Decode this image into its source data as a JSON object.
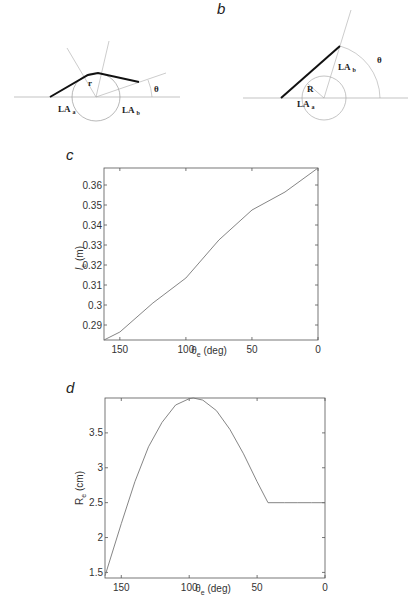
{
  "panels": {
    "a": {
      "label": "",
      "labels": {
        "r": "r",
        "la_a": "LA",
        "la_a_sub": "a",
        "la_b": "LA",
        "la_b_sub": "b",
        "theta": "θ"
      }
    },
    "b": {
      "label": "b",
      "labels": {
        "R": "R",
        "la_a": "LA",
        "la_a_sub": "a",
        "la_b": "LA",
        "la_b_sub": "b",
        "theta": "θ"
      }
    },
    "c": {
      "label": "c"
    },
    "d": {
      "label": "d"
    }
  },
  "chart_data": [
    {
      "panel": "c",
      "type": "line",
      "title": "",
      "xlabel": "θe (deg)",
      "ylabel": "le (m)",
      "xlim": [
        162,
        0
      ],
      "ylim": [
        0.2825,
        0.3685
      ],
      "xticks": [
        150,
        100,
        50,
        0
      ],
      "yticks": [
        0.29,
        0.3,
        0.31,
        0.32,
        0.33,
        0.34,
        0.35,
        0.36
      ],
      "ytick_labels": [
        "0.29",
        "0.3",
        "0.31",
        "0.32",
        "0.33",
        "0.34",
        "0.35",
        "0.36"
      ],
      "grid": false,
      "x": [
        162,
        150,
        125,
        100,
        75,
        50,
        25,
        0
      ],
      "y": [
        0.2825,
        0.2865,
        0.301,
        0.3135,
        0.3325,
        0.3475,
        0.3565,
        0.3685
      ]
    },
    {
      "panel": "d",
      "type": "line",
      "title": "",
      "xlabel": "θe (deg)",
      "ylabel": "Re (cm)",
      "xlim": [
        162,
        0
      ],
      "ylim": [
        1.42,
        4.0
      ],
      "xticks": [
        150,
        100,
        50,
        0
      ],
      "yticks": [
        1.5,
        2,
        2.5,
        3,
        3.5
      ],
      "ytick_labels": [
        "1.5",
        "2",
        "2.5",
        "3",
        "3.5"
      ],
      "grid": false,
      "x": [
        162,
        150,
        140,
        130,
        120,
        110,
        100,
        97,
        90,
        80,
        70,
        60,
        50,
        42,
        30,
        20,
        10,
        0
      ],
      "y": [
        1.45,
        2.2,
        2.8,
        3.3,
        3.65,
        3.9,
        3.99,
        4.0,
        3.97,
        3.82,
        3.55,
        3.2,
        2.8,
        2.5,
        2.5,
        2.5,
        2.5,
        2.5
      ]
    }
  ]
}
